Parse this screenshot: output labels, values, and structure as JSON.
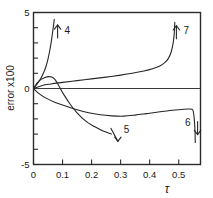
{
  "chart_data": {
    "type": "line",
    "title": "",
    "xlabel": "τ",
    "ylabel": "error x100",
    "xlim": [
      0,
      0.575
    ],
    "ylim": [
      -5,
      5
    ],
    "grid": false,
    "legend_position": "inline-curve-labels",
    "x_ticks": [
      "0",
      "0.1",
      "0.2",
      "0.3",
      "0.4",
      "0.5"
    ],
    "x_tick_values": [
      0,
      0.1,
      0.2,
      0.3,
      0.4,
      0.5
    ],
    "y_ticks": [
      "5",
      "0",
      "-5"
    ],
    "y_tick_values": [
      5,
      0,
      -5
    ],
    "y_minor_tick_values": [
      4,
      3,
      2,
      1,
      -1,
      -2,
      -3,
      -4
    ],
    "annotations": [
      {
        "label": "4",
        "x": 0.083,
        "y": 3.75,
        "arrow": "up"
      },
      {
        "label": "5",
        "x": 0.287,
        "y": -3.05,
        "arrow": "down"
      },
      {
        "label": "6",
        "x": 0.565,
        "y": -2.6,
        "arrow": "down"
      },
      {
        "label": "7",
        "x": 0.492,
        "y": 3.7,
        "arrow": "up"
      }
    ],
    "series": [
      {
        "name": "zero-line",
        "label": "",
        "points": [
          [
            0,
            0
          ],
          [
            0.575,
            0
          ]
        ]
      },
      {
        "name": "4",
        "label": "4",
        "points": [
          [
            0.0,
            0.0
          ],
          [
            0.012,
            0.28
          ],
          [
            0.024,
            0.62
          ],
          [
            0.034,
            1.0
          ],
          [
            0.043,
            1.45
          ],
          [
            0.05,
            1.95
          ],
          [
            0.056,
            2.5
          ],
          [
            0.061,
            3.05
          ],
          [
            0.065,
            3.6
          ],
          [
            0.069,
            4.15
          ],
          [
            0.0715,
            4.55
          ]
        ]
      },
      {
        "name": "5",
        "label": "5",
        "points": [
          [
            0.0,
            0.0
          ],
          [
            0.012,
            0.35
          ],
          [
            0.026,
            0.6
          ],
          [
            0.04,
            0.73
          ],
          [
            0.052,
            0.78
          ],
          [
            0.063,
            0.75
          ],
          [
            0.072,
            0.63
          ],
          [
            0.08,
            0.42
          ],
          [
            0.09,
            0.08
          ],
          [
            0.105,
            -0.42
          ],
          [
            0.125,
            -1.0
          ],
          [
            0.15,
            -1.6
          ],
          [
            0.18,
            -2.15
          ],
          [
            0.21,
            -2.5
          ],
          [
            0.24,
            -2.8
          ],
          [
            0.268,
            -3.0
          ]
        ]
      },
      {
        "name": "6",
        "label": "6",
        "points": [
          [
            0.0,
            0.0
          ],
          [
            0.02,
            -0.35
          ],
          [
            0.045,
            -0.65
          ],
          [
            0.075,
            -0.92
          ],
          [
            0.11,
            -1.15
          ],
          [
            0.15,
            -1.4
          ],
          [
            0.19,
            -1.6
          ],
          [
            0.23,
            -1.73
          ],
          [
            0.27,
            -1.8
          ],
          [
            0.31,
            -1.82
          ],
          [
            0.35,
            -1.75
          ],
          [
            0.39,
            -1.65
          ],
          [
            0.43,
            -1.55
          ],
          [
            0.47,
            -1.45
          ],
          [
            0.51,
            -1.38
          ],
          [
            0.535,
            -1.35
          ],
          [
            0.548,
            -1.4
          ],
          [
            0.553,
            -1.9
          ],
          [
            0.556,
            -2.8
          ],
          [
            0.557,
            -3.55
          ]
        ]
      },
      {
        "name": "7",
        "label": "7",
        "points": [
          [
            0.0,
            0.0
          ],
          [
            0.03,
            0.2
          ],
          [
            0.06,
            0.3
          ],
          [
            0.1,
            0.4
          ],
          [
            0.15,
            0.52
          ],
          [
            0.2,
            0.63
          ],
          [
            0.25,
            0.75
          ],
          [
            0.3,
            0.88
          ],
          [
            0.34,
            1.0
          ],
          [
            0.38,
            1.15
          ],
          [
            0.41,
            1.3
          ],
          [
            0.435,
            1.48
          ],
          [
            0.452,
            1.7
          ],
          [
            0.465,
            2.0
          ],
          [
            0.474,
            2.4
          ],
          [
            0.48,
            2.9
          ],
          [
            0.4835,
            3.4
          ],
          [
            0.4855,
            3.9
          ],
          [
            0.4865,
            4.35
          ]
        ]
      }
    ]
  },
  "axes": {
    "ylabel_text": "error x100",
    "xlabel_text": "τ"
  }
}
